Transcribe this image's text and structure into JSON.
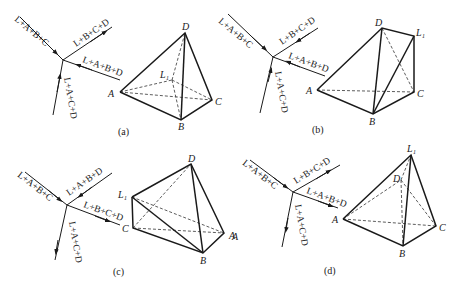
{
  "panels": [
    {
      "caption": "(a)",
      "streams": [
        {
          "label": "L+A+B+C",
          "direction": "in"
        },
        {
          "label": "L+B+C+D",
          "direction": "out"
        },
        {
          "label": "L+A+B+D",
          "direction": "in"
        },
        {
          "label": "L+A+C+D",
          "direction": "in"
        }
      ],
      "vertices": {
        "D": "D",
        "A": "A",
        "B": "B",
        "C": "C",
        "L1": "L₁"
      }
    },
    {
      "caption": "(b)",
      "streams": [
        {
          "label": "L+A+B+C",
          "direction": "in"
        },
        {
          "label": "L+B+C+D",
          "direction": "in"
        },
        {
          "label": "L+A+B+D",
          "direction": "in"
        },
        {
          "label": "L+A+C+D",
          "direction": "in"
        }
      ],
      "vertices": {
        "D": "D",
        "A": "A",
        "B": "B",
        "C": "C",
        "L1": "L₁"
      }
    },
    {
      "caption": "(c)",
      "streams": [
        {
          "label": "L+A+B+C",
          "direction": "in"
        },
        {
          "label": "L+A+B+D",
          "direction": "in"
        },
        {
          "label": "L+B+C+D",
          "direction": "out"
        },
        {
          "label": "L+A+C+D",
          "direction": "out"
        }
      ],
      "vertices": {
        "D": "D",
        "A": "A",
        "B": "B",
        "C": "C",
        "L1": "L₁"
      }
    },
    {
      "caption": "(d)",
      "streams": [
        {
          "label": "L+A+B+C",
          "direction": "in"
        },
        {
          "label": "L+B+C+D",
          "direction": "out"
        },
        {
          "label": "L+A+B+D",
          "direction": "out"
        },
        {
          "label": "L+A+C+D",
          "direction": "out"
        }
      ],
      "vertices": {
        "D": "D",
        "A": "A",
        "B": "B",
        "C": "C",
        "L1": "L₁"
      },
      "stray_label": "A"
    }
  ]
}
